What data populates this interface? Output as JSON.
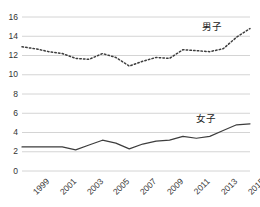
{
  "chart_data": {
    "type": "line",
    "title": "",
    "xlabel": "",
    "ylabel": "",
    "ylim": [
      0,
      16
    ],
    "yticks": [
      0,
      2,
      4,
      6,
      8,
      10,
      12,
      14,
      16
    ],
    "ytick_labels": [
      "0",
      "2",
      "4",
      "6",
      "8",
      "10",
      "12",
      "14",
      "16"
    ],
    "grid": true,
    "legend_position": "inline-annotation",
    "x": [
      1999,
      2000,
      2001,
      2002,
      2003,
      2004,
      2005,
      2006,
      2007,
      2008,
      2009,
      2010,
      2011,
      2012,
      2013,
      2014,
      2015,
      2016
    ],
    "xtick_values": [
      1999,
      2001,
      2003,
      2005,
      2007,
      2009,
      2011,
      2013,
      2015
    ],
    "xtick_labels": [
      "1999",
      "2001",
      "2003",
      "2005",
      "2007",
      "2009",
      "2011",
      "2013",
      "2015"
    ],
    "series": [
      {
        "name": "男子",
        "style": "dotted",
        "color": "#3d3d3d",
        "values": [
          12.9,
          12.7,
          12.4,
          12.2,
          11.7,
          11.6,
          12.2,
          11.8,
          10.9,
          11.4,
          11.8,
          11.7,
          12.6,
          12.5,
          12.4,
          12.7,
          13.9,
          14.8
        ]
      },
      {
        "name": "女子",
        "style": "solid",
        "color": "#3d3d3d",
        "values": [
          2.5,
          2.5,
          2.5,
          2.5,
          2.2,
          2.7,
          3.2,
          2.9,
          2.3,
          2.8,
          3.1,
          3.2,
          3.6,
          3.4,
          3.6,
          4.2,
          4.8,
          4.9
        ]
      }
    ],
    "annotations": [
      {
        "text": "男子",
        "x": 2013.0,
        "y": 15.2
      },
      {
        "text": "女子",
        "x": 2012.6,
        "y": 5.6
      }
    ]
  }
}
